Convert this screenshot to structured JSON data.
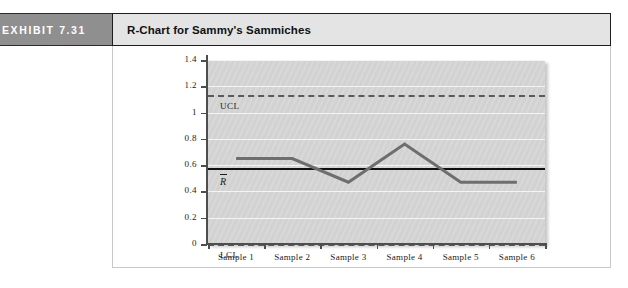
{
  "exhibit": {
    "label": "EXHIBIT 7.31"
  },
  "title": "R-Chart for Sammy's Sammiches",
  "chart_data": {
    "type": "line",
    "title": "R-Chart for Sammy's Sammiches",
    "xlabel": "",
    "ylabel": "",
    "categories": [
      "Sample 1",
      "Sample 2",
      "Sample 3",
      "Sample 4",
      "Sample 5",
      "Sample 6"
    ],
    "series": [
      {
        "name": "Sample Range",
        "values": [
          0.65,
          0.65,
          0.47,
          0.76,
          0.47,
          0.47
        ],
        "color": "#6e6e6e",
        "style": "solid"
      }
    ],
    "reference_lines": [
      {
        "name": "UCL",
        "label": "UCL",
        "value": 1.13,
        "style": "dashed",
        "color": "#5a5a5a"
      },
      {
        "name": "RBar",
        "label": "R",
        "value": 0.58,
        "style": "solid",
        "color": "#111111"
      },
      {
        "name": "LCL",
        "label": "LCL",
        "value": 0,
        "style": "dashed",
        "color": "#5a5a5a"
      }
    ],
    "ylim": [
      0,
      1.4
    ],
    "yticks": [
      0,
      0.2,
      0.4,
      0.6,
      0.8,
      1,
      1.2,
      1.4
    ],
    "ytick_labels": [
      "0",
      "0.2",
      "0.4",
      "0.6",
      "0.8",
      "1",
      "1.2",
      "1.4"
    ],
    "grid": true,
    "grid_color": "#f4f4f4",
    "plot_background": "#d6d6d6",
    "legend": "none"
  }
}
